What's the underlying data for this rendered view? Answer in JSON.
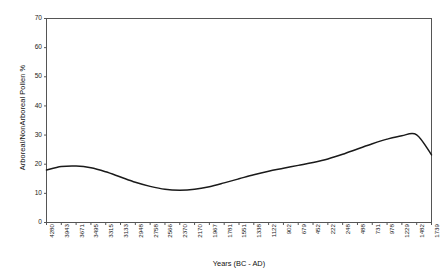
{
  "chart_data": {
    "type": "line",
    "title": "",
    "xlabel": "Years (BC - AD)",
    "ylabel": "Arboreal/NonArboreal Pollen %",
    "ylim": [
      0,
      70
    ],
    "yticks": [
      0,
      10,
      20,
      30,
      40,
      50,
      60,
      70
    ],
    "grid": false,
    "legend": null,
    "categories": [
      "4280",
      "3943",
      "3671",
      "3495",
      "3315",
      "3133",
      "2948",
      "2758",
      "2566",
      "2370",
      "2170",
      "1967",
      "1781",
      "1551",
      "1338",
      "1122",
      "902",
      "679",
      "452",
      "222",
      "248",
      "488",
      "731",
      "978",
      "1229",
      "1482",
      "1739"
    ],
    "values": [
      18.0,
      19.2,
      19.4,
      18.8,
      17.4,
      15.6,
      13.8,
      12.4,
      11.4,
      11.1,
      11.4,
      12.3,
      13.6,
      15.0,
      16.4,
      17.6,
      18.6,
      19.6,
      20.6,
      21.8,
      23.4,
      25.2,
      27.0,
      28.6,
      29.8,
      30.1,
      23.2
    ],
    "line_color": "#1a1a1a",
    "line_width": 1.5,
    "markers": false,
    "axis_color": "#555555",
    "background": "#ffffff"
  }
}
